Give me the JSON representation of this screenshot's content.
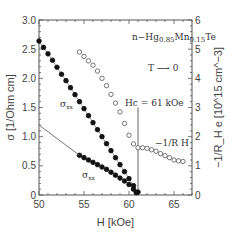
{
  "chart_data": {
    "type": "scatter",
    "title": "",
    "xlabel": "H [kOe]",
    "ylabel": "σ [1/Ohm cm]",
    "y2label": "−1/R_H e [10^15 cm^−3]",
    "xlim": [
      50,
      67
    ],
    "ylim": [
      0,
      3.0
    ],
    "y2lim": [
      0,
      6
    ],
    "x_ticks": [
      50,
      55,
      60,
      65
    ],
    "y_ticks": [
      "0",
      "0.5",
      "1.0",
      "1.5",
      "2.0",
      "2.5",
      "3.0"
    ],
    "y2_ticks": [
      "0",
      "1",
      "2",
      "3",
      "4",
      "5",
      "6"
    ],
    "grid": false,
    "annotations": {
      "material": "n−Hg0.85Mn0.15Te",
      "temperature": "T ⟶ 0",
      "critical_field": "Hc = 61  kOe",
      "hc_value": 61,
      "label_sigma_xx": "σxx",
      "label_sigma_xy": "σxx",
      "label_hall": "−1/R H"
    },
    "series": [
      {
        "name": "σxx (upper, filled)",
        "axis": "left",
        "marker": "filled-circle",
        "x": [
          50,
          50.5,
          51,
          51.5,
          52,
          52.5,
          53,
          53.5,
          54,
          54.5,
          55,
          55.5,
          56,
          56.5,
          57,
          57.5,
          58,
          58.5,
          59,
          59.5,
          60,
          60.5,
          61
        ],
        "values": [
          2.64,
          2.53,
          2.42,
          2.31,
          2.19,
          2.07,
          1.96,
          1.84,
          1.72,
          1.6,
          1.48,
          1.36,
          1.24,
          1.12,
          1.0,
          0.88,
          0.76,
          0.64,
          0.52,
          0.4,
          0.28,
          0.16,
          0.05
        ]
      },
      {
        "name": "σxx (lower, filled)",
        "axis": "left",
        "marker": "filled-circle",
        "x": [
          54.5,
          55,
          55.5,
          56,
          56.5,
          57,
          57.5,
          58,
          58.5,
          59,
          59.5,
          60,
          60.5,
          60.8
        ],
        "values": [
          0.68,
          0.64,
          0.6,
          0.56,
          0.52,
          0.48,
          0.44,
          0.39,
          0.34,
          0.29,
          0.24,
          0.18,
          0.1,
          0.04
        ]
      },
      {
        "name": "σxx extrapolation line",
        "axis": "left",
        "marker": "line",
        "x": [
          50,
          54.5
        ],
        "values": [
          1.2,
          0.68
        ]
      },
      {
        "name": "−1/R_H e (open)",
        "axis": "right",
        "marker": "open-circle",
        "x": [
          54.5,
          55,
          55.5,
          56,
          56.5,
          57,
          57.5,
          58,
          58.5,
          59,
          59.5,
          60,
          60.5,
          61,
          61.5,
          62,
          62.5,
          63,
          63.5,
          64,
          64.5,
          65,
          65.5,
          66
        ],
        "values": [
          4.9,
          4.75,
          4.6,
          4.45,
          4.25,
          4.0,
          3.75,
          3.45,
          3.15,
          2.85,
          2.45,
          2.05,
          1.75,
          1.62,
          1.62,
          1.6,
          1.55,
          1.5,
          1.42,
          1.35,
          1.28,
          1.2,
          1.17,
          1.15
        ]
      }
    ]
  }
}
